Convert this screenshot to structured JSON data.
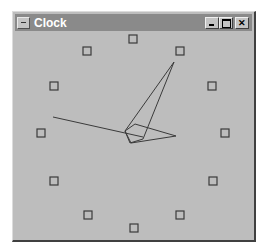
{
  "window": {
    "title": "Clock",
    "buttons": {
      "minimize": "minimize",
      "maximize": "maximize",
      "close": "close"
    }
  },
  "clock": {
    "colors": {
      "face": "#bdbdbd",
      "marker": "#3a3a3a",
      "hand": "#3a3a3a"
    },
    "markers": [
      {
        "hour": 12,
        "x": 133,
        "y": 39
      },
      {
        "hour": 1,
        "x": 180,
        "y": 51
      },
      {
        "hour": 2,
        "x": 212,
        "y": 86
      },
      {
        "hour": 3,
        "x": 225,
        "y": 133
      },
      {
        "hour": 4,
        "x": 213,
        "y": 181
      },
      {
        "hour": 5,
        "x": 180,
        "y": 215
      },
      {
        "hour": 6,
        "x": 134,
        "y": 228
      },
      {
        "hour": 7,
        "x": 88,
        "y": 215
      },
      {
        "hour": 8,
        "x": 54,
        "y": 181
      },
      {
        "hour": 9,
        "x": 41,
        "y": 133
      },
      {
        "hour": 10,
        "x": 54,
        "y": 86
      },
      {
        "hour": 11,
        "x": 87,
        "y": 51
      }
    ],
    "hands": {
      "minute": "125,131 174,62 143,139 130,143",
      "hour": "125,131 135,124 176,136 131,143",
      "second": {
        "x1": 53,
        "y1": 117,
        "x2": 143,
        "y2": 137
      }
    }
  }
}
